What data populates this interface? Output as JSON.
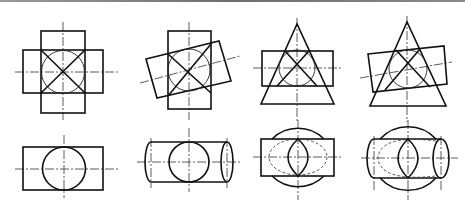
{
  "figure": {
    "line_color": "#111111",
    "background": "#ffffff",
    "top_views": [
      {
        "id": "1",
        "description": "Two perpendicular cylinders of equal diameter (cross shape) with X intersection lines"
      },
      {
        "id": "2",
        "description": "Vertical cylinder intersected by inclined cylinder with X intersection lines"
      },
      {
        "id": "3",
        "description": "Cone intersected by horizontal cylinder tangent to common sphere"
      },
      {
        "id": "4",
        "description": "Cone intersected by inclined cylinder tangent to common sphere"
      }
    ],
    "bottom_views": [
      {
        "id": "1",
        "description": "Cylinder side view with circle"
      },
      {
        "id": "2",
        "description": "Cylinder with end ellipses and circle"
      },
      {
        "id": "3",
        "description": "Sphere with rectangle, dashed ellipse and lens curve"
      },
      {
        "id": "4",
        "description": "Sphere with cylinder, end ellipse, dashed curve and lens curve"
      }
    ]
  }
}
